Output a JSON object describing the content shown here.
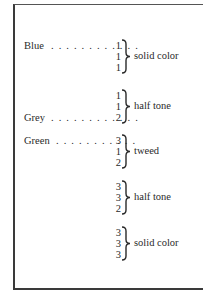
{
  "groups": [
    {
      "numbers": [
        "1",
        "1",
        "1"
      ],
      "note": "solid color",
      "label": "Blue",
      "label_row": 0,
      "dots": ". . . . . . . . . . . ."
    },
    {
      "numbers": [
        "1",
        "1",
        "2"
      ],
      "note": "half tone",
      "label": "Grey",
      "label_row": 2,
      "dots": ". . . . . . . . . . . ."
    },
    {
      "numbers": [
        "3",
        "1",
        "2"
      ],
      "note": "tweed",
      "label": "Green",
      "label_row": 0,
      "dots": ". . . . . . . . . . ."
    },
    {
      "numbers": [
        "3",
        "3",
        "2"
      ],
      "note": "half tone"
    },
    {
      "numbers": [
        "3",
        "3",
        "3"
      ],
      "note": "solid color"
    }
  ]
}
